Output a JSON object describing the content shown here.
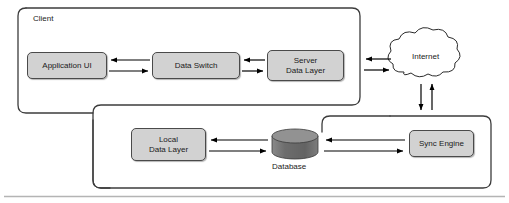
{
  "diagram": {
    "boundaries": [
      {
        "name": "client",
        "label": "Client"
      },
      {
        "name": "sync-region",
        "label": ""
      }
    ],
    "nodes": [
      {
        "id": "application-ui",
        "label": "Application UI",
        "shape": "rounded-rect"
      },
      {
        "id": "data-switch",
        "label": "Data Switch",
        "shape": "rounded-rect"
      },
      {
        "id": "server-data-layer",
        "label": "Server\nData Layer",
        "shape": "rounded-rect"
      },
      {
        "id": "local-data-layer",
        "label": "Local\nData Layer",
        "shape": "rounded-rect"
      },
      {
        "id": "sync-engine",
        "label": "Sync Engine",
        "shape": "rounded-rect"
      },
      {
        "id": "database",
        "label": "Database",
        "shape": "cylinder"
      },
      {
        "id": "internet",
        "label": "Internet",
        "shape": "cloud"
      }
    ],
    "connections": [
      {
        "from": "data-switch",
        "to": "application-ui",
        "direction": "bidirectional"
      },
      {
        "from": "server-data-layer",
        "to": "data-switch",
        "direction": "bidirectional"
      },
      {
        "from": "internet",
        "to": "server-data-layer",
        "direction": "bidirectional"
      },
      {
        "from": "internet",
        "to": "sync-region",
        "direction": "bidirectional"
      },
      {
        "from": "database",
        "to": "local-data-layer",
        "direction": "bidirectional"
      },
      {
        "from": "sync-engine",
        "to": "database",
        "direction": "bidirectional"
      }
    ],
    "colors": {
      "node_fill": "#d2d2d2",
      "node_stroke": "#4a4a4a",
      "cylinder_body": "#6e6e6e",
      "cylinder_top": "#909090",
      "boundary_stroke": "#3c3c3c",
      "arrow_stroke": "#000000",
      "rule_stroke": "#b4b4b4",
      "text": "#1a1a1a",
      "background": "#ffffff"
    }
  }
}
